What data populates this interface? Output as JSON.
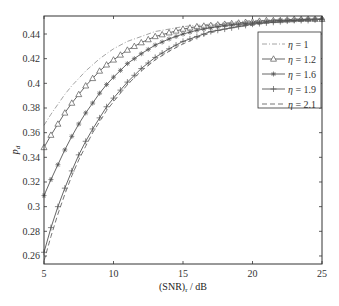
{
  "chart_data": {
    "type": "line",
    "title": "",
    "xlabel": "(SNR)",
    "xlabel_sub": "r",
    "xlabel_suffix": " / dB",
    "ylabel": "p",
    "ylabel_sub": "d",
    "xlim": [
      5,
      25
    ],
    "ylim": [
      0.2535,
      0.4546
    ],
    "xticks": [
      5,
      10,
      15,
      20,
      25
    ],
    "yticks": [
      0.26,
      0.28,
      0.3,
      0.32,
      0.34,
      0.36,
      0.38,
      0.4,
      0.42,
      0.44
    ],
    "ytick_labels": [
      "0.26",
      "0.28",
      "0.3",
      "0.32",
      "0.34",
      "0.36",
      "0.38",
      "0.4",
      "0.42",
      "0.44"
    ],
    "grid": false,
    "legend_position": "upper right",
    "x": [
      5,
      5.5,
      6,
      6.5,
      7,
      7.5,
      8,
      8.5,
      9,
      9.5,
      10,
      11,
      12,
      13,
      14,
      15,
      16,
      17,
      18,
      19,
      20,
      21,
      22,
      23,
      24,
      25
    ],
    "series": [
      {
        "name": "η = 1",
        "style": "dashdot",
        "marker": "none",
        "values": [
          0.366,
          0.375,
          0.383,
          0.391,
          0.398,
          0.404,
          0.41,
          0.415,
          0.42,
          0.424,
          0.428,
          0.434,
          0.438,
          0.442,
          0.444,
          0.446,
          0.447,
          0.448,
          0.449,
          0.45,
          0.451,
          0.451,
          0.452,
          0.452,
          0.452,
          0.452
        ]
      },
      {
        "name": "η = 1.2",
        "style": "solid",
        "marker": "triangle",
        "values": [
          0.348,
          0.358,
          0.367,
          0.376,
          0.384,
          0.391,
          0.398,
          0.404,
          0.41,
          0.415,
          0.419,
          0.427,
          0.433,
          0.438,
          0.441,
          0.444,
          0.446,
          0.447,
          0.448,
          0.449,
          0.45,
          0.451,
          0.451,
          0.452,
          0.452,
          0.452
        ]
      },
      {
        "name": "η = 1.6",
        "style": "solid",
        "marker": "star",
        "values": [
          0.309,
          0.322,
          0.334,
          0.346,
          0.357,
          0.367,
          0.376,
          0.384,
          0.392,
          0.399,
          0.405,
          0.416,
          0.424,
          0.431,
          0.436,
          0.44,
          0.443,
          0.445,
          0.447,
          0.448,
          0.449,
          0.45,
          0.451,
          0.451,
          0.452,
          0.452
        ]
      },
      {
        "name": "η = 1.9",
        "style": "solid",
        "marker": "plus",
        "values": [
          0.263,
          0.283,
          0.3,
          0.315,
          0.329,
          0.342,
          0.353,
          0.363,
          0.372,
          0.381,
          0.388,
          0.401,
          0.412,
          0.421,
          0.428,
          0.434,
          0.438,
          0.442,
          0.444,
          0.446,
          0.448,
          0.449,
          0.45,
          0.451,
          0.451,
          0.452
        ]
      },
      {
        "name": "η = 2.1",
        "style": "dashed",
        "marker": "none",
        "values": [
          0.256,
          0.276,
          0.294,
          0.31,
          0.325,
          0.338,
          0.349,
          0.36,
          0.369,
          0.378,
          0.385,
          0.399,
          0.41,
          0.419,
          0.426,
          0.432,
          0.437,
          0.441,
          0.444,
          0.446,
          0.447,
          0.449,
          0.45,
          0.45,
          0.451,
          0.452
        ]
      }
    ]
  },
  "legend": {
    "items": [
      {
        "eta": "η",
        "value": " = 1"
      },
      {
        "eta": "η",
        "value": " = 1.2"
      },
      {
        "eta": "η",
        "value": " = 1.6"
      },
      {
        "eta": "η",
        "value": " = 1.9"
      },
      {
        "eta": "η",
        "value": " = 2.1"
      }
    ]
  },
  "colors": {
    "axis": "#333333",
    "series": [
      "#9a9a9a",
      "#555555",
      "#555555",
      "#555555",
      "#666666"
    ]
  }
}
